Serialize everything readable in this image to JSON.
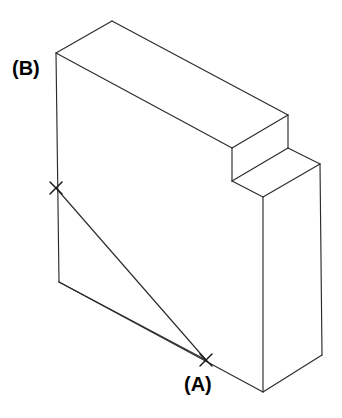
{
  "figure": {
    "kind": "isometric-technical-drawing",
    "background_color": "#ffffff",
    "line_color": "#2b2b2b",
    "marker_color": "#1a1a1a",
    "label_color": "#000000",
    "canvas": {
      "width": 342,
      "height": 418
    }
  },
  "labels": {
    "point_a": "(A)",
    "point_b": "(B)"
  },
  "markers": [
    {
      "name": "point-a-cross",
      "x": 206,
      "y": 360,
      "size": 11
    },
    {
      "name": "point-b-cross",
      "x": 56,
      "y": 188,
      "size": 11
    }
  ],
  "geometry": {
    "vertices": {
      "top_apex": [
        112,
        21
      ],
      "front_top_left": [
        56,
        53
      ],
      "top_right_corner": [
        288,
        115
      ],
      "front_top_notch": [
        232,
        148
      ],
      "notch_inner_bottom": [
        232,
        181
      ],
      "left_bottom": [
        59,
        282
      ],
      "front_lower_right_top": [
        263,
        197
      ],
      "front_bottom_vertex": [
        263,
        392
      ],
      "right_block_top_right": [
        320,
        164
      ],
      "right_block_bottom_right": [
        322,
        355
      ]
    },
    "edges": [
      "top_apex-front_top_left",
      "top_apex-top_right_corner",
      "front_top_left-front_top_notch",
      "front_top_left-left_bottom",
      "top_right_corner-front_top_notch",
      "top_right_corner-notch_inner_bottom",
      "front_top_notch-notch_inner_bottom",
      "notch_inner_bottom-right_block_top_right",
      "notch_inner_bottom-front_lower_right_top",
      "right_block_top_right-right_block_bottom_right",
      "right_block_bottom_right-front_bottom_vertex",
      "front_lower_right_top-front_bottom_vertex",
      "left_bottom-front_bottom_vertex"
    ],
    "leaders": [
      "point-b-cross-to-point-a-cross",
      "left_bottom-to-point-a-cross"
    ]
  }
}
